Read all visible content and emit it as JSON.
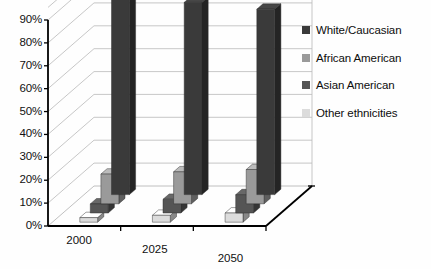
{
  "chart_data": {
    "type": "bar",
    "title": "",
    "xlabel": "",
    "ylabel": "",
    "categories": [
      "2000",
      "2025",
      "2050"
    ],
    "ylim": [
      0,
      90
    ],
    "ytick_labels": [
      "0%",
      "10%",
      "20%",
      "30%",
      "40%",
      "50%",
      "60%",
      "70%",
      "80%",
      "90%"
    ],
    "ytick_values": [
      0,
      10,
      20,
      30,
      40,
      50,
      60,
      70,
      80,
      90
    ],
    "grid": true,
    "legend_position": "right",
    "projection": "3d",
    "series": [
      {
        "name": "White/Caucasian",
        "values": [
          87,
          84,
          81
        ],
        "color": "#3a3a3a"
      },
      {
        "name": "African American",
        "values": [
          13,
          14,
          15
        ],
        "color": "#9a9a9a"
      },
      {
        "name": "Asian American",
        "values": [
          4,
          6,
          8
        ],
        "color": "#555555"
      },
      {
        "name": "Other ethnicities",
        "values": [
          2,
          3,
          4
        ],
        "color": "#dcdcdc"
      }
    ]
  },
  "legend": {
    "items": [
      {
        "label": "White/Caucasian",
        "swatch": "#3a3a3a"
      },
      {
        "label": "African American",
        "swatch": "#9a9a9a"
      },
      {
        "label": "Asian American",
        "swatch": "#555555"
      },
      {
        "label": "Other ethnicities",
        "swatch": "#dcdcdc"
      }
    ]
  },
  "axis": {
    "y_ticks": [
      "90%",
      "80%",
      "70%",
      "60%",
      "50%",
      "40%",
      "30%",
      "20%",
      "10%",
      "0%"
    ],
    "x_ticks": [
      "2000",
      "2025",
      "2050"
    ]
  }
}
